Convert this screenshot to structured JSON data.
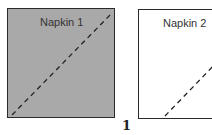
{
  "napkins": [
    {
      "label": "Napkin 1",
      "fill": "#a9a9a9"
    },
    {
      "label": "Napkin 2",
      "fill": "#ffffff"
    }
  ],
  "figure_number": "1",
  "fold_line_style": "dashed"
}
